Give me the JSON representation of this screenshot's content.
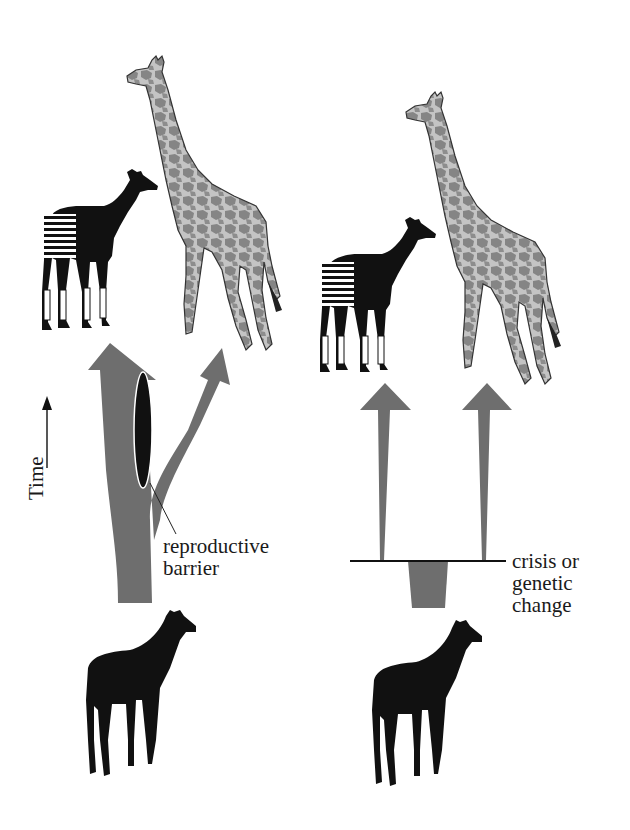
{
  "diagram": {
    "colors": {
      "arrow_gray": "#6e6e6e",
      "silhouette": "#111111",
      "background": "#ffffff",
      "giraffe_fill": "#b9b9b9",
      "giraffe_spots": "#7a7a7a"
    },
    "time_axis": {
      "label": "Time",
      "direction": "up"
    },
    "left_panel": {
      "name": "gradual-speciation",
      "ancestor": "okapi-like ancestor silhouette",
      "descendants": [
        "okapi",
        "giraffe"
      ],
      "annotation": {
        "line1": "reproductive",
        "line2": "barrier"
      }
    },
    "right_panel": {
      "name": "punctuated-speciation",
      "ancestor": "okapi-like ancestor silhouette",
      "descendants": [
        "okapi",
        "giraffe"
      ],
      "annotation": {
        "line1": "crisis or",
        "line2": "genetic",
        "line3": "change"
      }
    }
  }
}
